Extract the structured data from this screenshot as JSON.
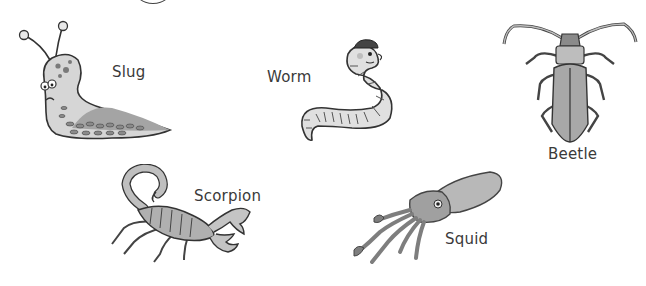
{
  "worksheet": {
    "animals": [
      {
        "name": "Slug",
        "icon": "slug-illustration"
      },
      {
        "name": "Worm",
        "icon": "worm-illustration"
      },
      {
        "name": "Beetle",
        "icon": "beetle-illustration"
      },
      {
        "name": "Scorpion",
        "icon": "scorpion-illustration"
      },
      {
        "name": "Squid",
        "icon": "squid-illustration"
      }
    ]
  },
  "colors": {
    "outline": "#333333",
    "fill_light": "#d2d2d2",
    "fill_mid": "#a8a8a8",
    "fill_dark": "#7a7a7a",
    "text": "#3a3a3a"
  }
}
